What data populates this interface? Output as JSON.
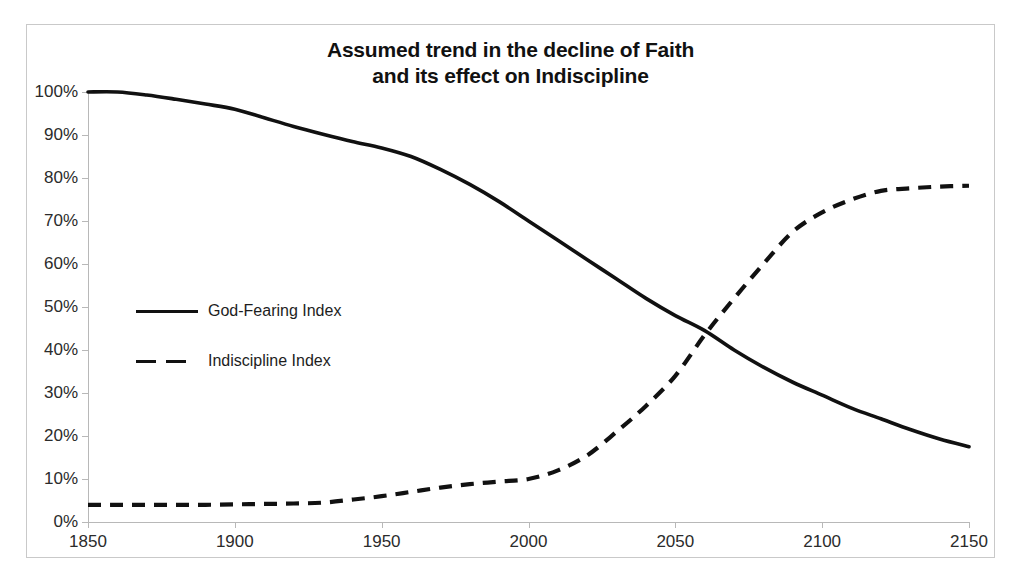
{
  "chart_data": {
    "type": "line",
    "title": "Assumed trend in the decline of Faith and its effect on Indiscipline",
    "title_lines": [
      "Assumed trend in the decline of Faith",
      "and its effect on Indiscipline"
    ],
    "xlabel": "",
    "ylabel": "",
    "xlim": [
      1850,
      2150
    ],
    "ylim": [
      0,
      100
    ],
    "grid": false,
    "legend_position": "inside-left-middle",
    "x_ticks": [
      1850,
      1900,
      1950,
      2000,
      2050,
      2100,
      2150
    ],
    "x_tick_labels": [
      "1850",
      "1900",
      "1950",
      "2000",
      "2050",
      "2100",
      "2150"
    ],
    "y_ticks": [
      0,
      10,
      20,
      30,
      40,
      50,
      60,
      70,
      80,
      90,
      100
    ],
    "y_tick_labels": [
      "0%",
      "10%",
      "20%",
      "30%",
      "40%",
      "50%",
      "60%",
      "70%",
      "80%",
      "90%",
      "100%"
    ],
    "series": [
      {
        "name": "God-Fearing Index",
        "style": "solid",
        "color": "#111111",
        "x": [
          1850,
          1860,
          1870,
          1880,
          1890,
          1900,
          1910,
          1920,
          1930,
          1940,
          1950,
          1960,
          1970,
          1980,
          1990,
          2000,
          2010,
          2020,
          2030,
          2040,
          2050,
          2060,
          2070,
          2080,
          2090,
          2100,
          2110,
          2120,
          2130,
          2140,
          2150
        ],
        "values": [
          100,
          100,
          99.3,
          98.3,
          97.2,
          96.0,
          94.0,
          92.0,
          90.2,
          88.5,
          87.0,
          85.0,
          82.0,
          78.5,
          74.5,
          70.0,
          65.5,
          61.0,
          56.5,
          52.0,
          48.0,
          44.5,
          40.0,
          36.0,
          32.5,
          29.5,
          26.5,
          24.0,
          21.5,
          19.3,
          17.5
        ]
      },
      {
        "name": "Indiscipline Index",
        "style": "dashed",
        "color": "#111111",
        "x": [
          1850,
          1860,
          1870,
          1880,
          1890,
          1900,
          1910,
          1920,
          1930,
          1940,
          1950,
          1960,
          1970,
          1980,
          1990,
          2000,
          2010,
          2020,
          2030,
          2040,
          2050,
          2060,
          2070,
          2080,
          2090,
          2100,
          2110,
          2120,
          2130,
          2140,
          2150
        ],
        "values": [
          4.0,
          4.0,
          4.0,
          4.0,
          4.0,
          4.1,
          4.2,
          4.3,
          4.5,
          5.2,
          6.0,
          7.0,
          8.0,
          8.8,
          9.4,
          10.0,
          12.0,
          15.5,
          21.0,
          27.0,
          34.0,
          43.5,
          52.0,
          60.0,
          67.5,
          72.0,
          75.0,
          77.0,
          77.6,
          78.0,
          78.2
        ]
      }
    ],
    "annotations": [
      {
        "label": "series crossover",
        "x": 2062,
        "y": 44.0
      }
    ]
  },
  "legend": {
    "entries": [
      {
        "label": "God-Fearing Index",
        "style": "solid"
      },
      {
        "label": "Indiscipline Index",
        "style": "dashed"
      }
    ]
  }
}
